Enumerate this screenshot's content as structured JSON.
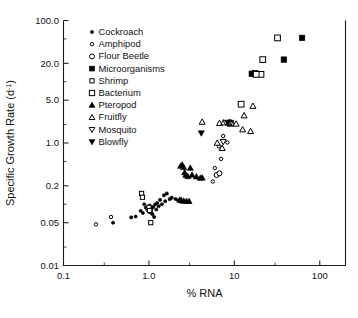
{
  "chart_data": {
    "type": "scatter",
    "title": "",
    "xlabel": "% RNA",
    "ylabel": "Specific Growth Rate (d-1)",
    "ylabel_main": "Specific Growth Rate (d",
    "ylabel_sup": "-1",
    "ylabel_tail": ")",
    "xscale": "log",
    "yscale": "log",
    "xlim": [
      0.1,
      200
    ],
    "ylim": [
      0.01,
      100
    ],
    "grid": false,
    "legend_position": "upper-left-inside",
    "xticks": [
      {
        "value": 0.1,
        "label": "0.1"
      },
      {
        "value": 1.0,
        "label": "1.0"
      },
      {
        "value": 10,
        "label": "10"
      },
      {
        "value": 100,
        "label": "100"
      }
    ],
    "yticks": [
      {
        "value": 0.01,
        "label": "0.01"
      },
      {
        "value": 0.05,
        "label": "0.05"
      },
      {
        "value": 0.2,
        "label": "0.2"
      },
      {
        "value": 1.0,
        "label": "1.0"
      },
      {
        "value": 5.0,
        "label": "5.0"
      },
      {
        "value": 20.0,
        "label": "20.0"
      },
      {
        "value": 100.0,
        "label": "100.0"
      }
    ],
    "series": [
      {
        "name": "Cockroach",
        "marker": "circle-filled",
        "size": 3.0,
        "points": [
          [
            0.38,
            0.05
          ],
          [
            0.62,
            0.061
          ],
          [
            0.7,
            0.063
          ],
          [
            0.8,
            0.078
          ],
          [
            0.85,
            0.072
          ],
          [
            0.92,
            0.088
          ],
          [
            0.98,
            0.083
          ],
          [
            1.0,
            0.079
          ],
          [
            1.02,
            0.095
          ],
          [
            1.05,
            0.073
          ],
          [
            1.08,
            0.086
          ],
          [
            1.1,
            0.069
          ],
          [
            1.12,
            0.09
          ],
          [
            1.15,
            0.062
          ],
          [
            1.18,
            0.099
          ],
          [
            1.25,
            0.105
          ],
          [
            1.3,
            0.093
          ],
          [
            1.35,
            0.118
          ],
          [
            1.42,
            0.1
          ],
          [
            1.5,
            0.14
          ],
          [
            1.55,
            0.112
          ],
          [
            1.62,
            0.15
          ],
          [
            1.75,
            0.121
          ],
          [
            1.85,
            0.128
          ],
          [
            2.05,
            0.122
          ],
          [
            2.2,
            0.115
          ],
          [
            0.88,
            0.1
          ],
          [
            1.22,
            0.082
          ]
        ]
      },
      {
        "name": "Amphipod",
        "marker": "circle-open-small",
        "size": 3.1,
        "points": [
          [
            0.24,
            0.047
          ],
          [
            0.36,
            0.062
          ],
          [
            1.0,
            0.08
          ],
          [
            1.05,
            0.084
          ],
          [
            5.6,
            0.235
          ],
          [
            5.9,
            0.39
          ],
          [
            6.4,
            0.31
          ],
          [
            6.8,
            0.32
          ],
          [
            6.1,
            0.3
          ],
          [
            7.4,
            1.3
          ],
          [
            8.3,
            1.02
          ],
          [
            6.6,
            0.88
          ],
          [
            7.0,
            0.55
          ]
        ]
      },
      {
        "name": "Flour Beetle",
        "marker": "circle-open",
        "size": 4.0,
        "points": [
          [
            0.98,
            0.082
          ],
          [
            1.03,
            0.077
          ],
          [
            6.2,
            0.3
          ],
          [
            6.7,
            0.32
          ]
        ]
      },
      {
        "name": "Microorganisms",
        "marker": "square-filled",
        "size": 5.2,
        "points": [
          [
            16.0,
            13.5
          ],
          [
            17.5,
            13.8
          ],
          [
            38.0,
            23.0
          ],
          [
            62.0,
            52.0
          ]
        ]
      },
      {
        "name": "Shrimp",
        "marker": "square-open-small",
        "size": 4.2,
        "points": [
          [
            0.82,
            0.15
          ],
          [
            0.84,
            0.13
          ],
          [
            1.0,
            0.089
          ],
          [
            1.02,
            0.079
          ],
          [
            1.05,
            0.05
          ]
        ]
      },
      {
        "name": "Bacterium",
        "marker": "square-open",
        "size": 5.2,
        "points": [
          [
            12.0,
            4.3
          ],
          [
            9.0,
            2.1
          ],
          [
            20.5,
            13.2
          ],
          [
            21.5,
            23.0
          ],
          [
            32.0,
            52.0
          ],
          [
            18.0,
            13.2
          ]
        ]
      },
      {
        "name": "Pteropod",
        "marker": "triangle-up-filled",
        "size": 5.0,
        "points": [
          [
            2.35,
            0.42
          ],
          [
            2.45,
            0.44
          ],
          [
            2.55,
            0.4
          ],
          [
            2.62,
            0.33
          ],
          [
            2.7,
            0.3
          ],
          [
            2.85,
            0.285
          ],
          [
            3.05,
            0.39
          ],
          [
            3.2,
            0.3
          ],
          [
            3.6,
            0.282
          ],
          [
            4.0,
            0.268
          ],
          [
            4.2,
            0.27
          ],
          [
            2.4,
            0.115
          ],
          [
            2.55,
            0.113
          ],
          [
            2.75,
            0.112
          ],
          [
            2.95,
            0.112
          ],
          [
            2.3,
            0.118
          ]
        ]
      },
      {
        "name": "Fruitfly",
        "marker": "triangle-up-open",
        "size": 5.0,
        "points": [
          [
            4.2,
            2.2
          ],
          [
            6.7,
            2.1
          ],
          [
            7.5,
            2.15
          ],
          [
            9.0,
            2.2
          ],
          [
            9.2,
            2.1
          ],
          [
            10.5,
            2.05
          ],
          [
            12.5,
            1.65
          ],
          [
            13.0,
            2.8
          ],
          [
            15.5,
            1.55
          ],
          [
            16.5,
            4.0
          ],
          [
            6.3,
            1.0
          ],
          [
            8.6,
            2.15
          ],
          [
            7.2,
            0.82
          ]
        ]
      },
      {
        "name": "Mosquito",
        "marker": "triangle-down-open",
        "size": 5.0,
        "points": [
          [
            7.4,
            1.05
          ],
          [
            8.0,
            2.15
          ],
          [
            8.6,
            2.1
          ]
        ]
      },
      {
        "name": "Blowfly",
        "marker": "triangle-down-filled",
        "size": 5.0,
        "points": [
          [
            4.1,
            1.45
          ],
          [
            8.4,
            2.15
          ]
        ]
      }
    ],
    "legend_entries": [
      {
        "label": "Cockroach",
        "marker": "circle-filled"
      },
      {
        "label": "Amphipod",
        "marker": "circle-open-small"
      },
      {
        "label": "Flour Beetle",
        "marker": "circle-open"
      },
      {
        "label": "Microorganisms",
        "marker": "square-filled"
      },
      {
        "label": "Shrimp",
        "marker": "square-open-small"
      },
      {
        "label": "Bacterium",
        "marker": "square-open"
      },
      {
        "label": "Pteropod",
        "marker": "triangle-up-filled"
      },
      {
        "label": "Fruitfly",
        "marker": "triangle-up-open"
      },
      {
        "label": "Mosquito",
        "marker": "triangle-down-open"
      },
      {
        "label": "Blowfly",
        "marker": "triangle-down-filled"
      }
    ]
  }
}
